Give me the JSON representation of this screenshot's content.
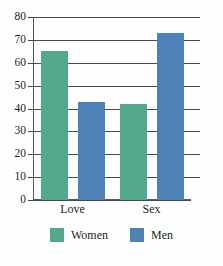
{
  "chart_data": {
    "type": "bar",
    "title": "",
    "subtitle": "",
    "xlabel": "",
    "ylabel": "",
    "categories": [
      "Love",
      "Sex"
    ],
    "series": [
      {
        "name": "Women",
        "values": [
          65,
          42
        ],
        "color": "#52a98d"
      },
      {
        "name": "Men",
        "values": [
          43,
          73
        ],
        "color": "#4e81b8"
      }
    ],
    "ylim": [
      0,
      80
    ],
    "ytick_step": 10,
    "ytick_labels": [
      "80",
      "70",
      "60",
      "50",
      "40",
      "30",
      "20",
      "10",
      "0"
    ],
    "ytick_values": [
      80,
      70,
      60,
      50,
      40,
      30,
      20,
      10,
      0
    ],
    "grid": true,
    "grid_axis": "y",
    "legend_position": "bottom",
    "legend_entries": [
      "Women",
      "Men"
    ],
    "bar_group_mode": "grouped"
  },
  "colors": {
    "women": "#52a98d",
    "men": "#4e81b8",
    "axis": "#58595b",
    "grid": "#4a4a4c",
    "text": "#231f20",
    "background": "#fefefe"
  }
}
